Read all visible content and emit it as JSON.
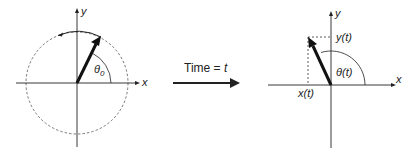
{
  "left": {
    "x_label": "x",
    "y_label": "y",
    "angle_label": "θ",
    "angle_sub": "0"
  },
  "middle": {
    "caption_prefix": "Time = ",
    "caption_var": "t"
  },
  "right": {
    "x_label": "x",
    "y_label": "y",
    "angle_label": "θ(t)",
    "xt_label": "x(t)",
    "yt_label": "y(t)"
  },
  "colors": {
    "ink": "#222222",
    "dash": "#555555"
  }
}
